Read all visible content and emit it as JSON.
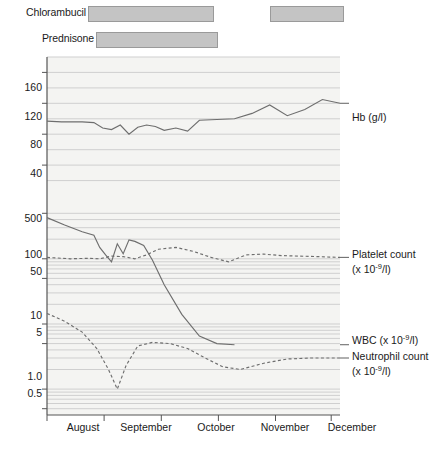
{
  "treatments": [
    {
      "name": "Chlorambucil",
      "label": "Chlorambucil",
      "bars": [
        {
          "start": 88,
          "end": 214
        },
        {
          "start": 270,
          "end": 344
        }
      ]
    },
    {
      "name": "Prednisone",
      "label": "Prednisone",
      "bars": [
        {
          "start": 96,
          "end": 218
        }
      ]
    }
  ],
  "chart_data": {
    "type": "line",
    "title": "",
    "xlabel": "",
    "grid": true,
    "legend": "right",
    "x_tick_labels": [
      "August",
      "September",
      "October",
      "November",
      "December"
    ],
    "panels": [
      {
        "name": "hb-panel",
        "scale": "linear",
        "ylim": [
          0,
          180
        ],
        "tick_labels": [
          "160",
          "120",
          "80",
          "40"
        ],
        "tick_values": [
          160,
          120,
          80,
          40
        ],
        "series": [
          {
            "name": "Hb",
            "label": "Hb (g/l)",
            "unit": "g/l",
            "style": "solid",
            "x": [
              0,
              5,
              12,
              16,
              19,
              22,
              25,
              28,
              31,
              34,
              37,
              40,
              44,
              48,
              52,
              58,
              64,
              70,
              76,
              82,
              88,
              94,
              100
            ],
            "values": [
              97,
              96,
              96,
              95,
              88,
              86,
              92,
              80,
              89,
              92,
              90,
              85,
              88,
              84,
              98,
              99,
              100,
              107,
              118,
              104,
              112,
              125,
              120
            ]
          }
        ]
      },
      {
        "name": "counts-panel",
        "scale": "log",
        "ylim": [
          0.4,
          800
        ],
        "tick_labels": [
          "500",
          "100",
          "50",
          "10",
          "5",
          "1.0",
          "0.5"
        ],
        "tick_values": [
          500,
          100,
          50,
          10,
          5,
          1.0,
          0.5
        ],
        "series": [
          {
            "name": "Platelet count",
            "label": "Platelet count",
            "unit": "x 10-9/l",
            "style": "solid",
            "x": [
              0,
              6,
              12,
              16,
              18,
              20,
              22,
              24,
              26,
              28,
              30,
              33,
              36,
              40,
              46,
              52,
              58,
              64
            ],
            "values": [
              430,
              330,
              260,
              230,
              150,
              115,
              90,
              170,
              120,
              195,
              185,
              160,
              95,
              40,
              14,
              6.5,
              5.0,
              4.8
            ]
          },
          {
            "name": "WBC",
            "label": "WBC (x 10-9/l)",
            "unit": "x 10-9/l",
            "style": "dashed",
            "x": [
              0,
              8,
              14,
              18,
              22,
              26,
              30,
              34,
              38,
              44,
              50,
              56,
              62,
              68,
              74,
              80,
              86,
              92,
              100
            ],
            "values": [
              105,
              100,
              102,
              100,
              110,
              108,
              100,
              115,
              140,
              150,
              130,
              105,
              90,
              115,
              118,
              112,
              110,
              108,
              105
            ]
          },
          {
            "name": "Neutrophil count",
            "label": "Neutrophil count",
            "unit": "x 10-9/l",
            "style": "dashed",
            "x": [
              0,
              6,
              12,
              17,
              21,
              24,
              27,
              31,
              36,
              42,
              48,
              54,
              60,
              66,
              74,
              82,
              90,
              100
            ],
            "values": [
              14.5,
              11.0,
              7.5,
              4.2,
              2.0,
              1.0,
              2.3,
              4.6,
              5.2,
              5.0,
              4.2,
              3.0,
              2.2,
              2.0,
              2.5,
              2.9,
              3.0,
              3.0
            ]
          }
        ]
      }
    ],
    "series_labels": [
      {
        "name": "hb",
        "line1": "Hb (g/l)",
        "line2": ""
      },
      {
        "name": "platelet",
        "line1": "Platelet count",
        "line2": "(x 10-9/l)"
      },
      {
        "name": "wbc",
        "line1": "WBC (x 10-9/l)",
        "line2": ""
      },
      {
        "name": "neutrophil",
        "line1": "Neutrophil count",
        "line2": "(x 10-9/l)"
      }
    ]
  },
  "colors": {
    "bar_fill": "#c4c4c4",
    "bar_stroke": "#9a9a9a",
    "axis": "#555555",
    "grid": "#cfcfcf",
    "line": "#6e6e6e",
    "plot_bg": "#f4f4f2"
  }
}
